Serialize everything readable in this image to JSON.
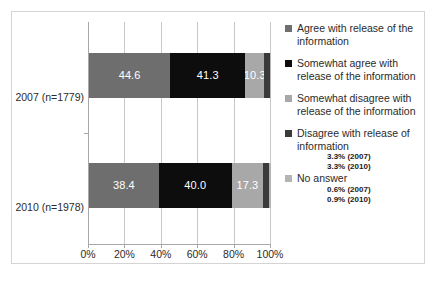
{
  "chart_data": {
    "type": "bar",
    "orientation": "horizontal",
    "stacked": true,
    "stack_mode": "percent",
    "title": "",
    "subtitle": "",
    "xlabel": "",
    "ylabel": "",
    "xlim": [
      0,
      100
    ],
    "xticks": [
      "0%",
      "20%",
      "40%",
      "60%",
      "80%",
      "100%"
    ],
    "xtick_values": [
      0,
      20,
      40,
      60,
      80,
      100
    ],
    "grid": "vertical",
    "legend_position": "right",
    "categories": [
      "2007 (n=1779)",
      "2010 (n=1978)"
    ],
    "series": [
      {
        "name": "Agree with release of the information",
        "color": "#6e6e6e",
        "values": [
          44.6,
          38.4
        ],
        "labels": [
          "44.6",
          "38.4"
        ],
        "show_labels": true
      },
      {
        "name": "Somewhat agree with release of the information",
        "color": "#0d0d0d",
        "values": [
          41.3,
          40.0
        ],
        "labels": [
          "41.3",
          "40.0"
        ],
        "show_labels": true
      },
      {
        "name": "Somewhat disagree with release of the information",
        "color": "#a8a8a8",
        "values": [
          10.3,
          17.3
        ],
        "labels": [
          "10.3",
          "17.3"
        ],
        "show_labels": true
      },
      {
        "name": "Disagree with release of information",
        "color": "#3a3a3a",
        "values": [
          3.3,
          3.3
        ],
        "labels": [
          "",
          ""
        ],
        "show_labels": false,
        "annotations": [
          "3.3% (2007)",
          "3.3% (2010)"
        ]
      },
      {
        "name": "No answer",
        "color": "#b4b4b4",
        "values": [
          0.6,
          0.9
        ],
        "labels": [
          "",
          ""
        ],
        "show_labels": false,
        "annotations": [
          "0.6% (2007)",
          "0.9% (2010)"
        ]
      }
    ]
  },
  "axis": {
    "ytick_labels": [
      "2007 (n=1779)",
      "2010 (n=1978)"
    ],
    "xtick_labels": [
      "0%",
      "20%",
      "40%",
      "60%",
      "80%",
      "100%"
    ]
  },
  "legend": {
    "entries": [
      {
        "label": "Agree with release of the information",
        "color": "#6e6e6e",
        "sub": []
      },
      {
        "label": "Somewhat agree with release of the information",
        "color": "#0d0d0d",
        "sub": []
      },
      {
        "label": "Somewhat disagree with release of the information",
        "color": "#a8a8a8",
        "sub": []
      },
      {
        "label": "Disagree with release of information",
        "color": "#3a3a3a",
        "sub": [
          "3.3% (2007)",
          "3.3% (2010)"
        ]
      },
      {
        "label": "No answer",
        "color": "#b4b4b4",
        "sub": [
          "0.6% (2007)",
          "0.9% (2010)"
        ]
      }
    ]
  },
  "style": {
    "frame_color": "#d4d4d4",
    "grid_color": "#c8c8c8",
    "axis_color": "#a8a8a8",
    "text_color": "#2b2b2b",
    "bar_label_color": "#ffffff",
    "background": "#ffffff"
  }
}
